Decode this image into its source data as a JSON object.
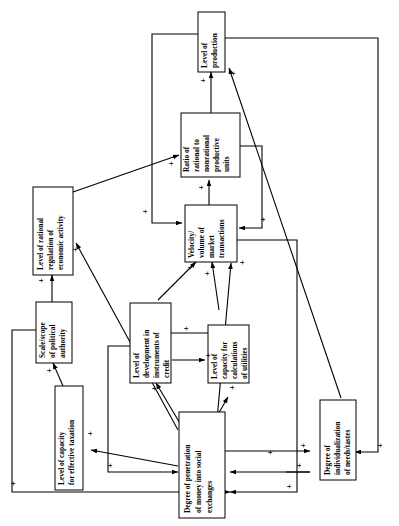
{
  "diagram": {
    "type": "causal-loop-diagram",
    "orientation": "rotated-90-ccw",
    "polarity_symbol": "+",
    "nodes": [
      {
        "id": "production",
        "label": "Level of production"
      },
      {
        "id": "ratio",
        "label": "Ratio of rational to nonrational productive units"
      },
      {
        "id": "velocity",
        "label": "Velocity/ volume of market transactions"
      },
      {
        "id": "regulation",
        "label": "Level of rational regulation of economic activity"
      },
      {
        "id": "authority",
        "label": "Scale/scope of political authority"
      },
      {
        "id": "taxation",
        "label": "Level of capacity for effective taxation"
      },
      {
        "id": "credit",
        "label": "Level of development in instruments of credit"
      },
      {
        "id": "utilities",
        "label": "Level of capacity for calculations of utilities"
      },
      {
        "id": "penetration",
        "label": "Degree of penetration of money into social exchanges"
      },
      {
        "id": "individualization",
        "label": "Degree of individualization of needs/tastes"
      }
    ],
    "node_lines": {
      "production": [
        "Level of",
        "production"
      ],
      "ratio": [
        "Ratio of",
        "rational to",
        "nonrational",
        "productive",
        "units"
      ],
      "velocity": [
        "Velocity/",
        "volume of",
        "market",
        "transactions"
      ],
      "regulation": [
        "Level of rational",
        "regulation of",
        "economic activity"
      ],
      "authority": [
        "Scale/scope",
        "of political",
        "authority"
      ],
      "taxation": [
        "Level of capacity",
        "for effective taxation"
      ],
      "credit": [
        "Level of",
        "development in",
        "instruments of",
        "credit"
      ],
      "utilities": [
        "Level of",
        "capacity for",
        "calculations",
        "of utilities"
      ],
      "penetration": [
        "Degree of penetration",
        "of money into social",
        "exchanges"
      ],
      "individualization": [
        "Degree of",
        "individualization",
        "of needs/tastes"
      ]
    },
    "edges": [
      {
        "from": "velocity",
        "to": "ratio",
        "sign": "+"
      },
      {
        "from": "ratio",
        "to": "production",
        "sign": "+"
      },
      {
        "from": "velocity",
        "to": "production",
        "sign": "+"
      },
      {
        "from": "production",
        "to": "velocity",
        "sign": "+"
      },
      {
        "from": "ratio",
        "to": "velocity",
        "sign": "+"
      },
      {
        "from": "regulation",
        "to": "ratio",
        "sign": "+"
      },
      {
        "from": "authority",
        "to": "regulation",
        "sign": "+"
      },
      {
        "from": "taxation",
        "to": "authority",
        "sign": "+"
      },
      {
        "from": "penetration",
        "to": "regulation",
        "sign": "+"
      },
      {
        "from": "penetration",
        "to": "taxation",
        "sign": "+"
      },
      {
        "from": "penetration",
        "to": "credit",
        "sign": "+"
      },
      {
        "from": "penetration",
        "to": "utilities",
        "sign": "+"
      },
      {
        "from": "credit",
        "to": "velocity",
        "sign": "+"
      },
      {
        "from": "utilities",
        "to": "velocity",
        "sign": "+"
      },
      {
        "from": "utilities",
        "to": "credit",
        "sign": "+"
      },
      {
        "from": "credit",
        "to": "utilities",
        "sign": "+"
      },
      {
        "from": "penetration",
        "to": "velocity",
        "sign": "+"
      },
      {
        "from": "penetration",
        "to": "individualization",
        "sign": "+"
      },
      {
        "from": "individualization",
        "to": "production",
        "sign": "+"
      },
      {
        "from": "individualization",
        "to": "penetration",
        "sign": "+"
      },
      {
        "from": "production",
        "to": "individualization",
        "sign": "+"
      },
      {
        "from": "velocity",
        "to": "penetration",
        "sign": "+"
      },
      {
        "from": "authority",
        "to": "penetration",
        "sign": "+"
      },
      {
        "from": "credit",
        "to": "penetration",
        "sign": "+"
      }
    ],
    "plus_count": 24
  },
  "colors": {
    "line": "#000000",
    "box_fill": "#ffffff",
    "background": "#ffffff"
  }
}
